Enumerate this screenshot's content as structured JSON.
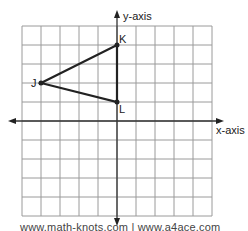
{
  "diagram": {
    "type": "coordinate-plane",
    "axes": {
      "x_label": "x-axis",
      "y_label": "y-axis"
    },
    "grid": {
      "x_range": [
        -5,
        5
      ],
      "y_range": [
        -5,
        5
      ],
      "cell_px": 19,
      "origin_px": [
        117,
        121
      ]
    },
    "points": [
      {
        "name": "K",
        "x": 0,
        "y": 4
      },
      {
        "name": "J",
        "x": -4,
        "y": 2
      },
      {
        "name": "L",
        "x": 0,
        "y": 1
      }
    ],
    "polygon": [
      "J",
      "K",
      "L"
    ],
    "colors": {
      "grid": "#9a9a9a",
      "axis": "#333333",
      "shape": "#222222"
    }
  },
  "footer": {
    "text": "www.math-knots.com | www.a4ace.com"
  }
}
